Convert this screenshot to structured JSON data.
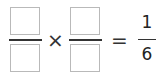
{
  "equation": {
    "fraction1": {
      "numerator": "",
      "denominator": ""
    },
    "operator": "×",
    "fraction2": {
      "numerator": "",
      "denominator": ""
    },
    "equals": "=",
    "result": {
      "numerator": "1",
      "denominator": "6"
    }
  }
}
